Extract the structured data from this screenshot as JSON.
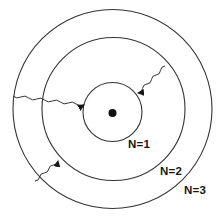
{
  "diagram": {
    "type": "bohr-model-energy-levels",
    "background_color": "#ffffff",
    "line_color": "#333333",
    "text_color": "#161616",
    "nucleus": {
      "symbol": "filled-dot",
      "color": "#111111"
    },
    "orbits": [
      {
        "label": "N=1"
      },
      {
        "label": "N=2"
      },
      {
        "label": "N=3"
      }
    ],
    "photon_arrows": [
      {
        "from": "N=3",
        "to": "N=1",
        "position": "left",
        "style": "wavy-arrow"
      },
      {
        "from": "N=2",
        "to": "N=1",
        "position": "upper-right",
        "style": "wavy-arrow"
      },
      {
        "from": "N=3",
        "to": "N=2",
        "position": "lower-left",
        "style": "wavy-arrow"
      }
    ]
  }
}
